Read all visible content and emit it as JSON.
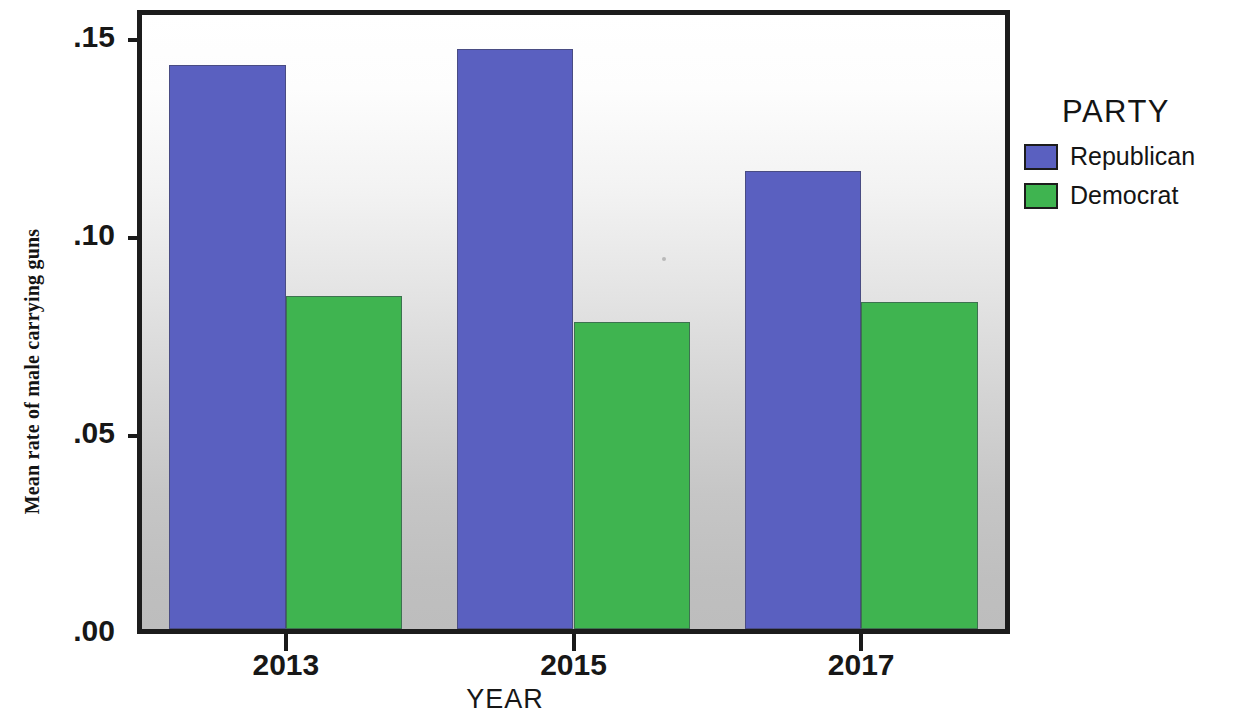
{
  "chart_data": {
    "type": "bar",
    "title": "",
    "xlabel": "YEAR",
    "ylabel": "Mean rate of male carrying guns",
    "categories": [
      "2013",
      "2015",
      "2017"
    ],
    "series": [
      {
        "name": "Republican",
        "color": "#5a60c0",
        "values": [
          0.1425,
          0.1465,
          0.1155
        ]
      },
      {
        "name": "Democrat",
        "color": "#3fb450",
        "values": [
          0.084,
          0.0775,
          0.0825
        ]
      }
    ],
    "ylim": [
      0.0,
      0.155
    ],
    "y_ticks": [
      {
        "label": ".15",
        "value": 0.15
      },
      {
        "label": ".10",
        "value": 0.1
      },
      {
        "label": ".05",
        "value": 0.05
      },
      {
        "label": ".00",
        "value": 0.0
      }
    ],
    "grid": false,
    "legend": {
      "title": "PARTY",
      "position": "right",
      "entries": [
        {
          "label": "Republican",
          "color": "#5a60c0"
        },
        {
          "label": "Democrat",
          "color": "#3fb450"
        }
      ]
    },
    "plot_background": "white-to-gray vertical gradient",
    "frame_color": "#1c1c1c"
  }
}
